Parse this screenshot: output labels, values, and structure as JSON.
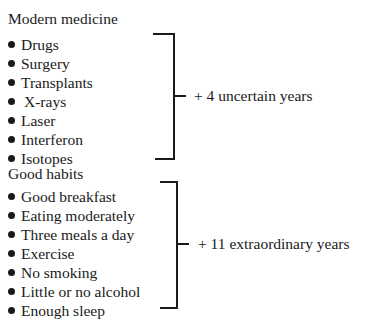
{
  "groups": [
    {
      "heading": "Modern medicine",
      "items": [
        "Drugs",
        "Surgery",
        "Transplants",
        "X-rays",
        "Laser",
        "Interferon",
        "Isotopes"
      ],
      "result": "+ 4 uncertain years"
    },
    {
      "heading": "Good habits",
      "items": [
        "Good breakfast",
        "Eating moderately",
        "Three meals a day",
        "Exercise",
        "No smoking",
        "Little or no alcohol",
        "Enough sleep"
      ],
      "result": "+ 11 extraordinary years"
    }
  ]
}
